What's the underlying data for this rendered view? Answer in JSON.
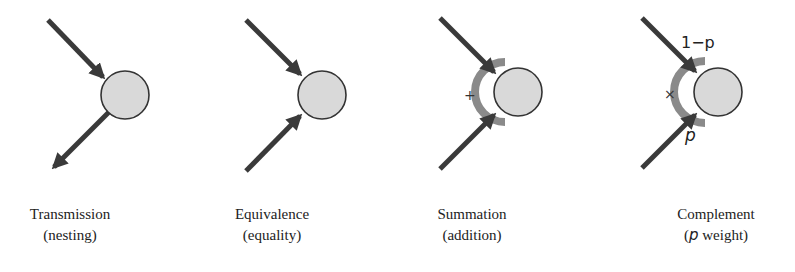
{
  "panels": [
    {
      "title": "Transmission",
      "subtitle": "(nesting)",
      "operator": ""
    },
    {
      "title": "Equivalence",
      "subtitle": "(equality)",
      "operator": ""
    },
    {
      "title": "Summation",
      "subtitle": "(addition)",
      "operator": "+"
    },
    {
      "title": "Complement",
      "subtitle_prefix": "(",
      "subtitle_var": "p",
      "subtitle_rest": " weight)",
      "operator": "×",
      "top_weight": "1−p",
      "bottom_weight": "p"
    }
  ],
  "colors": {
    "arrow": "#3a3a3a",
    "node_fill": "#d9d9d9",
    "node_stroke": "#333333",
    "arc": "#8a8a8a"
  }
}
